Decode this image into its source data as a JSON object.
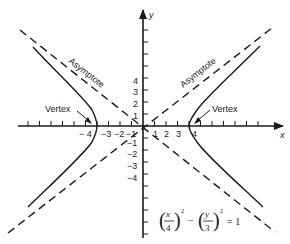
{
  "diagram": {
    "type": "hyperbola-graph",
    "axes": {
      "x_label": "x",
      "y_label": "y",
      "x_tick_labels": [
        {
          "value": -4,
          "text": "− 4"
        },
        {
          "value": -3,
          "text": "−3"
        },
        {
          "value": -2,
          "text": "−2"
        },
        {
          "value": -1,
          "text": "−1"
        },
        {
          "value": 1,
          "text": "1"
        },
        {
          "value": 2,
          "text": "2"
        },
        {
          "value": 3,
          "text": "3"
        },
        {
          "value": 4,
          "text": "4"
        }
      ],
      "y_tick_labels": [
        {
          "value": 4,
          "text": "4"
        },
        {
          "value": 3,
          "text": "3"
        },
        {
          "value": 2,
          "text": "2"
        },
        {
          "value": 1,
          "text": "1"
        },
        {
          "value": -1,
          "text": "−1"
        },
        {
          "value": -2,
          "text": "−2"
        },
        {
          "value": -3,
          "text": "−3"
        },
        {
          "value": -4,
          "text": "−4"
        }
      ]
    },
    "labels": {
      "asymptote_left": "Asymptote",
      "asymptote_right": "Asymptote",
      "vertex_left": "Vertex",
      "vertex_right": "Vertex"
    },
    "equation": {
      "x_num": "x",
      "x_den": "4",
      "y_num": "y",
      "y_den": "3",
      "exp": "2",
      "minus": "−",
      "rhs": "= 1"
    },
    "colors": {
      "ink": "#1a1a1a",
      "background": "#ffffff"
    }
  }
}
